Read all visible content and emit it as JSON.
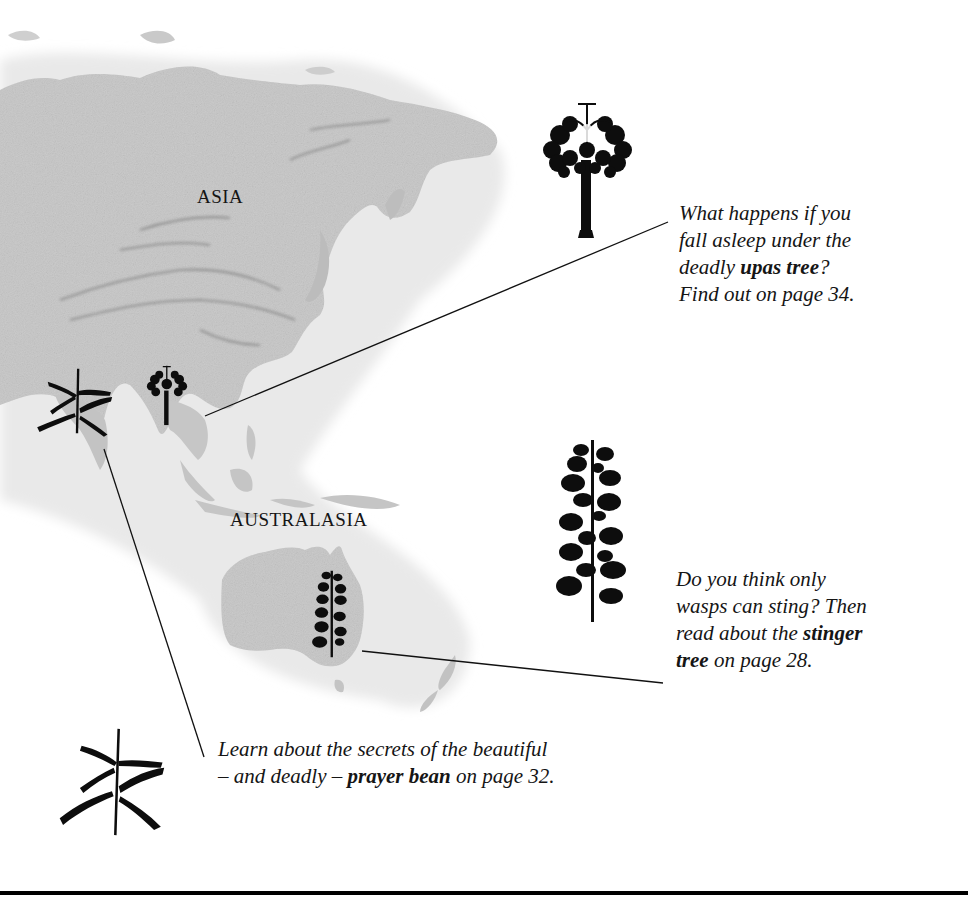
{
  "map": {
    "regions": [
      {
        "id": "asia",
        "label": "ASIA"
      },
      {
        "id": "australasia",
        "label": "AUSTRALASIA"
      }
    ]
  },
  "callouts": {
    "upas": {
      "tree_name": "upas tree",
      "line1": "What happens if you",
      "line2": "fall asleep under the",
      "line3_pre": "deadly ",
      "line3_bold": "upas tree",
      "line3_post": "?",
      "line4": "Find out on page 34.",
      "page": 34,
      "icon": "upas-tree-icon"
    },
    "stinger": {
      "tree_name": "stinger tree",
      "line1": "Do you think only",
      "line2": "wasps can sting? Then",
      "line3_pre": "read about the ",
      "line3_bold": "stinger",
      "line4_bold": "tree",
      "line4_post": " on page 28.",
      "page": 28,
      "icon": "stinger-tree-icon"
    },
    "prayer_bean": {
      "plant_name": "prayer bean",
      "line1": "Learn about the secrets of the beautiful",
      "line2_pre": "– and deadly – ",
      "line2_bold": "prayer bean",
      "line2_post": " on page 32.",
      "page": 32,
      "icon": "prayer-bean-icon"
    }
  },
  "colors": {
    "land": "#c9c9c9",
    "land_dark": "#9a9a9a",
    "ink": "#111111",
    "background": "#ffffff"
  }
}
